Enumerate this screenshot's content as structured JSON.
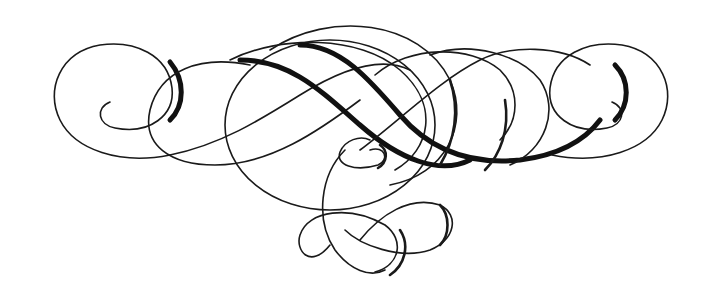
{
  "image": {
    "description": "Decorative calligraphic flourish ornament",
    "background": "#ffffff",
    "ink_color": "#1a1a1a"
  }
}
